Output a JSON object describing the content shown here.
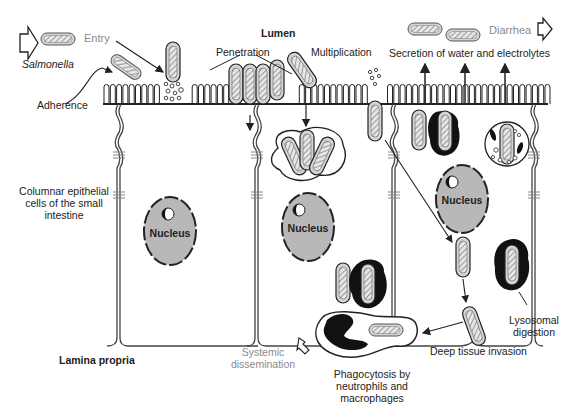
{
  "regions": {
    "lumen": "Lumen",
    "lamina_propria": "Lamina propria"
  },
  "labels": {
    "salmonella": "Salmonella",
    "entry": "Entry",
    "adherence": "Adherence",
    "penetration": "Penetration",
    "multiplication": "Multiplication",
    "secretion": "Secretion of water and electrolytes",
    "diarrhea": "Diarrhea",
    "columnar_line1": "Columnar epithelial",
    "columnar_line2": "cells of the small",
    "columnar_line3": "intestine",
    "lysosomal_line1": "Lysosomal",
    "lysosomal_line2": "digestion",
    "deep_tissue": "Deep tissue invasion",
    "systemic_line1": "Systemic",
    "systemic_line2": "dissemination",
    "phago_line1": "Phagocytosis by",
    "phago_line2": "neutrophils and",
    "phago_line3": "macrophages"
  },
  "nuclei": [
    {
      "label": "Nucleus"
    },
    {
      "label": "Nucleus"
    },
    {
      "label": "Nucleus"
    }
  ],
  "icons": {
    "hollow_arrow": "hollow-block-arrow",
    "bacterium": "hatched-rod-bacterium"
  },
  "colors": {
    "ink": "#222222",
    "gray_text": "#8a8a8a",
    "nucleus_fill": "#b8b8b8",
    "bacterium_fill": "#d4d4d4"
  }
}
